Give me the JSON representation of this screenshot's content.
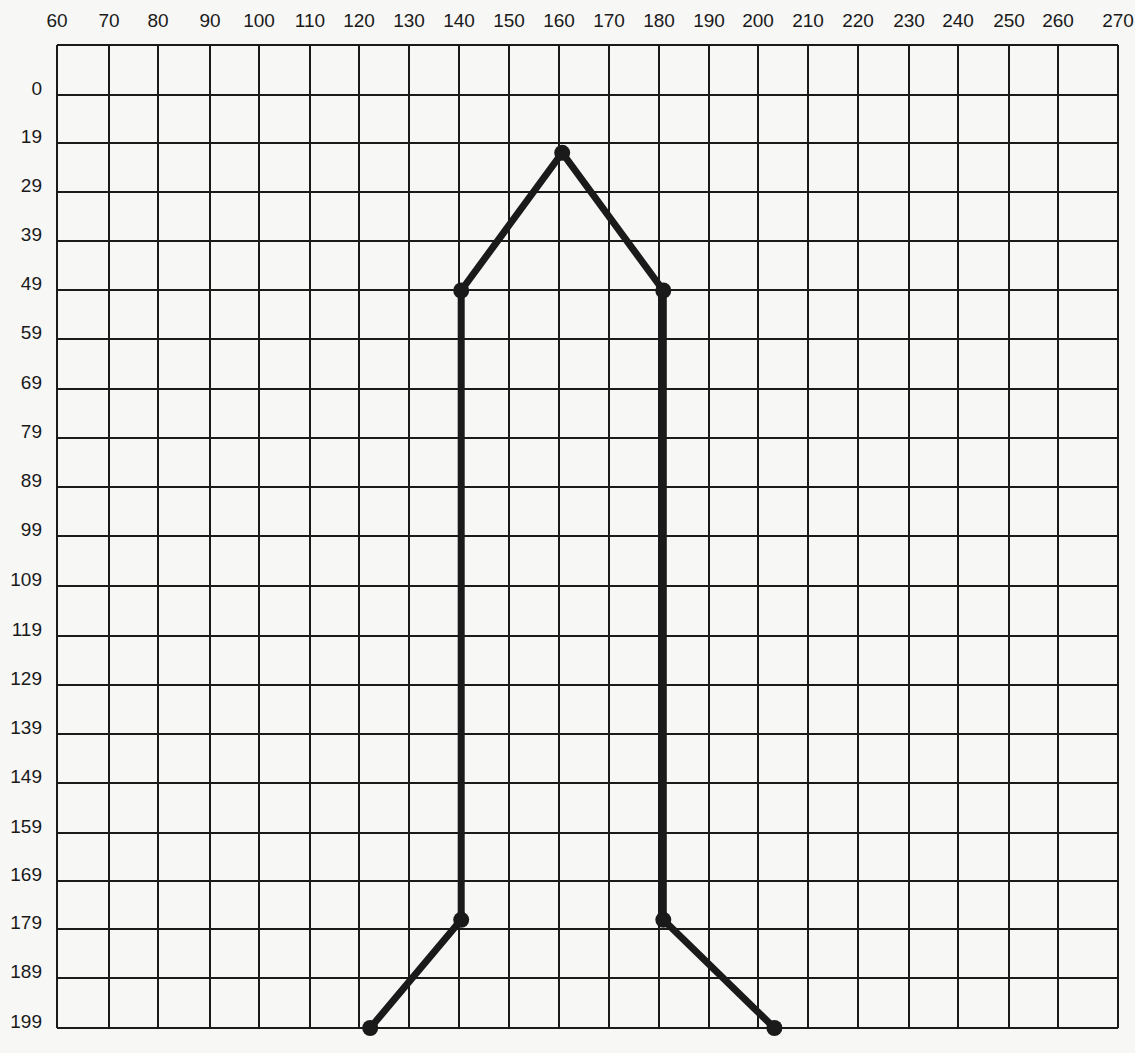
{
  "diagram": {
    "type": "coordinate-grid-figure",
    "x_axis": {
      "position": "top",
      "labels": [
        "60",
        "70",
        "80",
        "90",
        "100",
        "110",
        "120",
        "130",
        "140",
        "150",
        "160",
        "170",
        "180",
        "190",
        "200",
        "210",
        "220",
        "230",
        "240",
        "250",
        "260",
        "270"
      ]
    },
    "y_axis": {
      "position": "left",
      "labels": [
        "0",
        "19",
        "29",
        "39",
        "49",
        "59",
        "69",
        "79",
        "89",
        "99",
        "109",
        "119",
        "129",
        "139",
        "149",
        "159",
        "169",
        "179",
        "189",
        "199"
      ]
    },
    "figure": {
      "stroke_color": "#1a1a1a",
      "points": [
        {
          "name": "left-foot",
          "x": 122,
          "y": 199
        },
        {
          "name": "left-lower-joint",
          "x": 140,
          "y": 177
        },
        {
          "name": "left-shoulder",
          "x": 140,
          "y": 49
        },
        {
          "name": "apex",
          "x": 160,
          "y": 21
        },
        {
          "name": "right-shoulder",
          "x": 180,
          "y": 49
        },
        {
          "name": "right-lower-joint",
          "x": 180,
          "y": 177
        },
        {
          "name": "right-foot",
          "x": 202,
          "y": 199
        }
      ]
    },
    "colors": {
      "background": "#f7f7f5",
      "grid": "#1a1a1a",
      "figure": "#1a1a1a"
    }
  }
}
